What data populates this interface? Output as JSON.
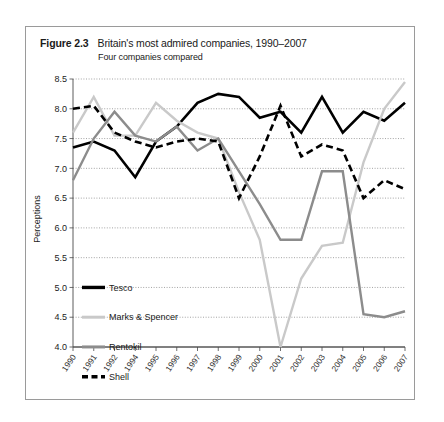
{
  "figure": {
    "number": "Figure 2.3",
    "title": "Britain's most admired companies, 1990–2007",
    "subtitle": "Four companies compared"
  },
  "chart_data": {
    "type": "line",
    "title": "Britain's most admired companies, 1990–2007",
    "subtitle": "Four companies compared",
    "xlabel": "",
    "ylabel": "Perceptions",
    "ylim": [
      4.0,
      8.5
    ],
    "ytick_labels": [
      "4.0",
      "4.5",
      "5.0",
      "5.5",
      "6.0",
      "6.5",
      "7.0",
      "7.5",
      "8.0",
      "8.5"
    ],
    "ytick_values": [
      4.0,
      4.5,
      5.0,
      5.5,
      6.0,
      6.5,
      7.0,
      7.5,
      8.0,
      8.5
    ],
    "grid": true,
    "grid_axis": "y",
    "legend_position": "bottom-left",
    "categories": [
      "1990",
      "1991",
      "1992",
      "1994",
      "1995",
      "1996",
      "1997",
      "1998",
      "1999",
      "2000",
      "2001",
      "2002",
      "2003",
      "2004",
      "2005",
      "2006",
      "2007"
    ],
    "series": [
      {
        "name": "Tesco",
        "color": "#000000",
        "style": "solid",
        "width": 2.6,
        "values": [
          7.35,
          7.45,
          7.3,
          6.85,
          7.45,
          7.7,
          8.1,
          8.25,
          8.2,
          7.85,
          7.95,
          7.6,
          8.2,
          7.6,
          7.95,
          7.8,
          8.1
        ]
      },
      {
        "name": "Marks & Spencer",
        "color": "#c9c9c9",
        "style": "solid",
        "width": 2.4,
        "values": [
          7.6,
          8.2,
          7.55,
          7.55,
          8.1,
          7.8,
          7.6,
          7.5,
          6.6,
          5.8,
          4.0,
          5.15,
          5.7,
          5.75,
          7.1,
          8.0,
          8.45
        ]
      },
      {
        "name": "Rentokil",
        "color": "#8c8c8c",
        "style": "solid",
        "width": 2.4,
        "values": [
          6.8,
          7.5,
          7.95,
          7.55,
          7.45,
          7.7,
          7.3,
          7.5,
          6.95,
          6.4,
          5.8,
          5.8,
          6.95,
          6.95,
          4.55,
          4.5,
          4.6
        ]
      },
      {
        "name": "Shell",
        "color": "#000000",
        "style": "dashed",
        "width": 2.6,
        "dash": "7 4",
        "values": [
          8.0,
          8.05,
          7.6,
          7.45,
          7.35,
          7.45,
          7.5,
          7.45,
          6.5,
          7.2,
          8.05,
          7.2,
          7.4,
          7.3,
          6.5,
          6.8,
          6.65
        ]
      }
    ]
  },
  "legend": {
    "items": [
      {
        "label": "Tesco",
        "color": "#000000",
        "style": "solid",
        "width": 3.4
      },
      {
        "label": "Marks & Spencer",
        "color": "#c9c9c9",
        "style": "solid",
        "width": 3.0
      },
      {
        "label": "Rentokil",
        "color": "#8c8c8c",
        "style": "solid",
        "width": 3.0
      },
      {
        "label": "Shell",
        "color": "#000000",
        "style": "dashed",
        "width": 3.4,
        "dash": "6 3.5"
      }
    ]
  }
}
